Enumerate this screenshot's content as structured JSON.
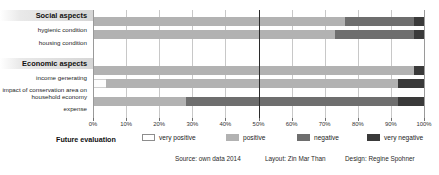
{
  "chart_data": {
    "type": "bar",
    "orientation": "horizontal",
    "stacked": true,
    "stack_mode": "percent",
    "title": "",
    "xlabel": "",
    "ylabel": "",
    "xlim": [
      0,
      100
    ],
    "xticks": [
      "0%",
      "10%",
      "20%",
      "30%",
      "40%",
      "50%",
      "60%",
      "70%",
      "80%",
      "90%",
      "100%"
    ],
    "xtick_values": [
      0,
      10,
      20,
      30,
      40,
      50,
      60,
      70,
      80,
      90,
      100
    ],
    "grid": true,
    "emphasis_line_at": 50,
    "legend_position": "bottom",
    "groups": [
      {
        "name": "Social aspects",
        "categories": [
          "hygienic condition",
          "housing condition"
        ]
      },
      {
        "name": "Economic aspects",
        "categories": [
          "income generating",
          "impact of conservation area on\nhousehold economy",
          "expense"
        ]
      }
    ],
    "categories": [
      "hygienic condition",
      "housing condition",
      "income generating",
      "impact of conservation area on household economy",
      "expense"
    ],
    "series": [
      {
        "name": "very positive",
        "color": "#ffffff",
        "values": [
          0,
          0,
          0,
          4,
          0
        ]
      },
      {
        "name": "positive",
        "color": "#b2b2b2",
        "values": [
          76,
          73,
          97,
          88,
          28
        ]
      },
      {
        "name": "negative",
        "color": "#6e6e6e",
        "values": [
          21,
          24,
          0,
          0,
          64
        ]
      },
      {
        "name": "very negative",
        "color": "#3a3a3a",
        "values": [
          3,
          3,
          3,
          8,
          8
        ]
      }
    ]
  },
  "legend": {
    "title": "Future evaluation",
    "items": [
      {
        "label": "very positive"
      },
      {
        "label": "positive"
      },
      {
        "label": "negative"
      },
      {
        "label": "very negative"
      }
    ]
  },
  "footer": {
    "source": "Source: own data 2014",
    "layout": "Layout: Zin Mar Than",
    "design": "Design: Regine Spohner"
  }
}
